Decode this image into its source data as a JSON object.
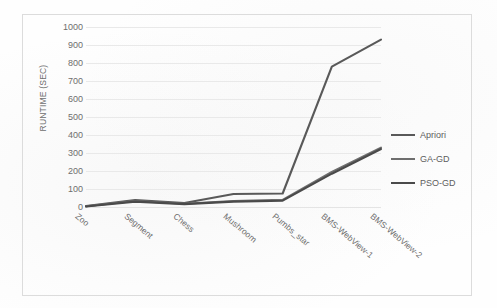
{
  "chart_data": {
    "type": "line",
    "title": "",
    "xlabel": "",
    "ylabel": "RUNTIME (SEC)",
    "categories": [
      "Zoo",
      "Segment",
      "Chess",
      "Mushroom",
      "Pumbs_star",
      "BMS-WebView-1",
      "BMS-WebView-2"
    ],
    "ylim": [
      0,
      1000
    ],
    "yticks": [
      0,
      100,
      200,
      300,
      400,
      500,
      600,
      700,
      800,
      900,
      1000
    ],
    "ytick_labels": [
      "0",
      "100",
      "200",
      "300",
      "400",
      "500",
      "600",
      "700",
      "800",
      "900",
      "1000"
    ],
    "grid": "horizontal",
    "legend_position": "right",
    "series": [
      {
        "name": "Apriori",
        "color": "#595959",
        "values": [
          5,
          38,
          22,
          72,
          75,
          780,
          930
        ]
      },
      {
        "name": "GA-GD",
        "color": "#6e6e6e",
        "values": [
          4,
          33,
          18,
          33,
          40,
          195,
          330
        ]
      },
      {
        "name": "PSO-GD",
        "color": "#4a4a4a",
        "values": [
          3,
          30,
          16,
          30,
          35,
          185,
          322
        ]
      }
    ]
  },
  "axes": {
    "y_title": "RUNTIME (SEC)"
  },
  "legend": {
    "items": [
      {
        "label": "Apriori"
      },
      {
        "label": "GA-GD"
      },
      {
        "label": "PSO-GD"
      }
    ]
  },
  "style": {
    "page_background": "#fefefe",
    "frame_border": "#dcdcdc",
    "gridline": "#e9e9e9",
    "tick_text": "#6e6e6e"
  }
}
